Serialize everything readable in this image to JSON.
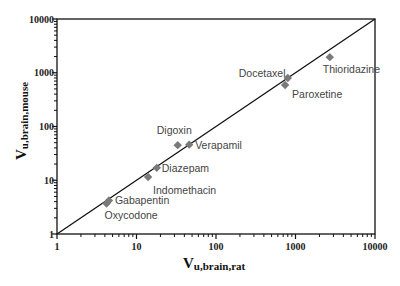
{
  "chart_data": {
    "type": "scatter",
    "title": "",
    "xlabel": "V",
    "xlabel_sub": "u,brain,rat",
    "ylabel": "V",
    "ylabel_sub": "u,brain,mouse",
    "xscale": "log",
    "yscale": "log",
    "xlim": [
      1,
      10000
    ],
    "ylim": [
      1,
      10000
    ],
    "x_ticks": [
      "1",
      "10",
      "100",
      "1000",
      "10000"
    ],
    "y_ticks": [
      "1",
      "10",
      "100",
      "1000",
      "10000"
    ],
    "grid": false,
    "legend": null,
    "marker": "diamond",
    "marker_color": "#7a7a7a",
    "reference_line": {
      "label": "line of unity",
      "x": [
        1,
        10000
      ],
      "y": [
        1,
        10000
      ]
    },
    "points": [
      {
        "name": "Gabapentin",
        "x": 4.5,
        "y": 4.2
      },
      {
        "name": "Oxycodone",
        "x": 4.2,
        "y": 3.7
      },
      {
        "name": "Indomethacin",
        "x": 14,
        "y": 11.5
      },
      {
        "name": "Diazepam",
        "x": 18,
        "y": 17
      },
      {
        "name": "Digoxin",
        "x": 33,
        "y": 45
      },
      {
        "name": "Verapamil",
        "x": 46,
        "y": 46
      },
      {
        "name": "Docetaxel",
        "x": 800,
        "y": 800
      },
      {
        "name": "Paroxetine",
        "x": 740,
        "y": 590
      },
      {
        "name": "Thioridazine",
        "x": 2700,
        "y": 1950
      }
    ]
  },
  "labels": {
    "Gabapentin": {
      "text": "Gabapentin",
      "dx": 6,
      "dy": 3,
      "anchor": "start"
    },
    "Oxycodone": {
      "text": "Oxycodone",
      "dx": -2,
      "dy": 16,
      "anchor": "start"
    },
    "Indomethacin": {
      "text": "Indomethacin",
      "dx": 5,
      "dy": 17,
      "anchor": "start"
    },
    "Diazepam": {
      "text": "Diazepam",
      "dx": 5,
      "dy": 4,
      "anchor": "start"
    },
    "Digoxin": {
      "text": "Digoxin",
      "dx": -21,
      "dy": -11,
      "anchor": "start"
    },
    "Verapamil": {
      "text": "Verapamil",
      "dx": 6,
      "dy": 4,
      "anchor": "start"
    },
    "Docetaxel": {
      "text": "Docetaxel",
      "dx": -49,
      "dy": -1,
      "anchor": "start"
    },
    "Paroxetine": {
      "text": "Paroxetine",
      "dx": 7,
      "dy": 13,
      "anchor": "start"
    },
    "Thioridazine": {
      "text": "Thioridazine",
      "dx": -7,
      "dy": 16,
      "anchor": "start"
    }
  }
}
